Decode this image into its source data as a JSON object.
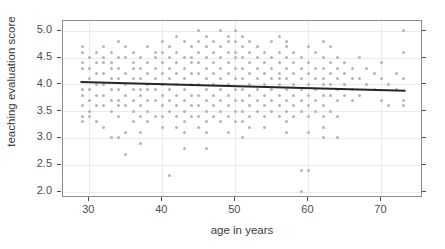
{
  "chart_data": {
    "type": "scatter",
    "title": "",
    "subtitle": "",
    "xlabel": "age in years",
    "ylabel": "teaching evaluation score",
    "xlim": [
      26.4,
      75.7
    ],
    "ylim": [
      1.88,
      5.18
    ],
    "xticks": [
      30,
      40,
      50,
      60,
      70
    ],
    "xtick_labels": [
      "30",
      "40",
      "50",
      "60",
      "70"
    ],
    "yticks": [
      2.0,
      2.5,
      3.0,
      3.5,
      4.0,
      4.5,
      5.0
    ],
    "ytick_labels": [
      "2.0",
      "2.5",
      "3.0",
      "3.5",
      "4.0",
      "4.5",
      "5.0"
    ],
    "grid": true,
    "legend": "none",
    "point_color": "#b4b4b4",
    "line_color": "#262626",
    "panel_border_color": "#8c8c8c",
    "grid_color": "#ebebeb",
    "series": [
      {
        "name": "teaching ratings",
        "marker": "circle",
        "points": [
          [
            29,
            4.3
          ],
          [
            29,
            4.4
          ],
          [
            29,
            4.6
          ],
          [
            29,
            4.7
          ],
          [
            29,
            3.9
          ],
          [
            29,
            3.8
          ],
          [
            29,
            3.6
          ],
          [
            29,
            3.4
          ],
          [
            29,
            3.3
          ],
          [
            30,
            4.3
          ],
          [
            30,
            4.5
          ],
          [
            30,
            4.1
          ],
          [
            30,
            3.9
          ],
          [
            30,
            3.7
          ],
          [
            30,
            3.5
          ],
          [
            30,
            3.4
          ],
          [
            31,
            4.6
          ],
          [
            31,
            4.4
          ],
          [
            31,
            4.2
          ],
          [
            31,
            4.0
          ],
          [
            31,
            3.8
          ],
          [
            31,
            3.6
          ],
          [
            31,
            3.3
          ],
          [
            32,
            4.7
          ],
          [
            32,
            4.5
          ],
          [
            32,
            4.4
          ],
          [
            32,
            4.2
          ],
          [
            32,
            4.0
          ],
          [
            32,
            3.8
          ],
          [
            32,
            3.6
          ],
          [
            32,
            3.2
          ],
          [
            33,
            4.6
          ],
          [
            33,
            4.4
          ],
          [
            33,
            4.3
          ],
          [
            33,
            4.1
          ],
          [
            33,
            3.9
          ],
          [
            33,
            3.7
          ],
          [
            33,
            3.5
          ],
          [
            33,
            3.0
          ],
          [
            34,
            4.8
          ],
          [
            34,
            4.5
          ],
          [
            34,
            4.3
          ],
          [
            34,
            4.1
          ],
          [
            34,
            3.9
          ],
          [
            34,
            3.7
          ],
          [
            34,
            3.6
          ],
          [
            34,
            3.4
          ],
          [
            34,
            3.0
          ],
          [
            35,
            4.7
          ],
          [
            35,
            4.5
          ],
          [
            35,
            4.2
          ],
          [
            35,
            4.0
          ],
          [
            35,
            3.8
          ],
          [
            35,
            3.6
          ],
          [
            35,
            3.1
          ],
          [
            35,
            2.7
          ],
          [
            36,
            4.6
          ],
          [
            36,
            4.4
          ],
          [
            36,
            4.3
          ],
          [
            36,
            4.1
          ],
          [
            36,
            3.9
          ],
          [
            36,
            3.7
          ],
          [
            36,
            3.5
          ],
          [
            36,
            3.3
          ],
          [
            37,
            4.5
          ],
          [
            37,
            4.3
          ],
          [
            37,
            4.1
          ],
          [
            37,
            3.9
          ],
          [
            37,
            3.8
          ],
          [
            37,
            3.6
          ],
          [
            37,
            3.4
          ],
          [
            37,
            3.1
          ],
          [
            37,
            2.9
          ],
          [
            38,
            4.7
          ],
          [
            38,
            4.4
          ],
          [
            38,
            4.2
          ],
          [
            38,
            4.0
          ],
          [
            38,
            3.9
          ],
          [
            38,
            3.7
          ],
          [
            38,
            3.5
          ],
          [
            38,
            3.3
          ],
          [
            39,
            4.6
          ],
          [
            39,
            4.5
          ],
          [
            39,
            4.3
          ],
          [
            39,
            4.1
          ],
          [
            39,
            3.9
          ],
          [
            39,
            3.7
          ],
          [
            39,
            3.4
          ],
          [
            40,
            4.8
          ],
          [
            40,
            4.6
          ],
          [
            40,
            4.4
          ],
          [
            40,
            4.2
          ],
          [
            40,
            4.0
          ],
          [
            40,
            3.8
          ],
          [
            40,
            3.6
          ],
          [
            40,
            3.4
          ],
          [
            40,
            3.2
          ],
          [
            41,
            4.7
          ],
          [
            41,
            4.5
          ],
          [
            41,
            4.3
          ],
          [
            41,
            4.1
          ],
          [
            41,
            3.9
          ],
          [
            41,
            3.7
          ],
          [
            41,
            3.5
          ],
          [
            41,
            2.3
          ],
          [
            42,
            4.9
          ],
          [
            42,
            4.6
          ],
          [
            42,
            4.4
          ],
          [
            42,
            4.2
          ],
          [
            42,
            4.0
          ],
          [
            42,
            3.8
          ],
          [
            42,
            3.6
          ],
          [
            42,
            3.4
          ],
          [
            42,
            3.2
          ],
          [
            43,
            4.8
          ],
          [
            43,
            4.5
          ],
          [
            43,
            4.3
          ],
          [
            43,
            4.1
          ],
          [
            43,
            3.9
          ],
          [
            43,
            3.7
          ],
          [
            43,
            3.5
          ],
          [
            43,
            3.3
          ],
          [
            43,
            3.1
          ],
          [
            43,
            2.8
          ],
          [
            44,
            4.7
          ],
          [
            44,
            4.5
          ],
          [
            44,
            4.4
          ],
          [
            44,
            4.2
          ],
          [
            44,
            4.0
          ],
          [
            44,
            3.8
          ],
          [
            44,
            3.6
          ],
          [
            44,
            3.4
          ],
          [
            45,
            5.0
          ],
          [
            45,
            4.8
          ],
          [
            45,
            4.6
          ],
          [
            45,
            4.4
          ],
          [
            45,
            4.2
          ],
          [
            45,
            4.0
          ],
          [
            45,
            3.8
          ],
          [
            45,
            3.6
          ],
          [
            45,
            3.4
          ],
          [
            45,
            3.2
          ],
          [
            46,
            4.9
          ],
          [
            46,
            4.7
          ],
          [
            46,
            4.5
          ],
          [
            46,
            4.3
          ],
          [
            46,
            4.1
          ],
          [
            46,
            3.9
          ],
          [
            46,
            3.7
          ],
          [
            46,
            3.5
          ],
          [
            46,
            3.3
          ],
          [
            46,
            3.1
          ],
          [
            46,
            2.8
          ],
          [
            47,
            4.8
          ],
          [
            47,
            4.6
          ],
          [
            47,
            4.4
          ],
          [
            47,
            4.2
          ],
          [
            47,
            4.0
          ],
          [
            47,
            3.8
          ],
          [
            47,
            3.6
          ],
          [
            47,
            3.4
          ],
          [
            48,
            5.0
          ],
          [
            48,
            4.7
          ],
          [
            48,
            4.5
          ],
          [
            48,
            4.3
          ],
          [
            48,
            4.1
          ],
          [
            48,
            3.9
          ],
          [
            48,
            3.7
          ],
          [
            48,
            3.5
          ],
          [
            48,
            3.3
          ],
          [
            49,
            4.9
          ],
          [
            49,
            4.8
          ],
          [
            49,
            4.6
          ],
          [
            49,
            4.4
          ],
          [
            49,
            4.2
          ],
          [
            49,
            4.0
          ],
          [
            49,
            3.8
          ],
          [
            49,
            3.6
          ],
          [
            49,
            3.4
          ],
          [
            49,
            3.1
          ],
          [
            50,
            5.0
          ],
          [
            50,
            4.8
          ],
          [
            50,
            4.6
          ],
          [
            50,
            4.5
          ],
          [
            50,
            4.3
          ],
          [
            50,
            4.1
          ],
          [
            50,
            3.9
          ],
          [
            50,
            3.7
          ],
          [
            50,
            3.5
          ],
          [
            50,
            3.3
          ],
          [
            51,
            4.9
          ],
          [
            51,
            4.7
          ],
          [
            51,
            4.5
          ],
          [
            51,
            4.3
          ],
          [
            51,
            4.1
          ],
          [
            51,
            3.9
          ],
          [
            51,
            3.7
          ],
          [
            51,
            3.5
          ],
          [
            51,
            3.3
          ],
          [
            51,
            3.0
          ],
          [
            52,
            4.8
          ],
          [
            52,
            4.6
          ],
          [
            52,
            4.4
          ],
          [
            52,
            4.2
          ],
          [
            52,
            4.0
          ],
          [
            52,
            3.8
          ],
          [
            52,
            3.6
          ],
          [
            52,
            3.4
          ],
          [
            52,
            3.2
          ],
          [
            53,
            4.7
          ],
          [
            53,
            4.5
          ],
          [
            53,
            4.3
          ],
          [
            53,
            4.1
          ],
          [
            53,
            3.9
          ],
          [
            53,
            3.7
          ],
          [
            53,
            3.5
          ],
          [
            54,
            4.6
          ],
          [
            54,
            4.4
          ],
          [
            54,
            4.2
          ],
          [
            54,
            4.0
          ],
          [
            54,
            3.8
          ],
          [
            54,
            3.6
          ],
          [
            54,
            3.4
          ],
          [
            54,
            3.2
          ],
          [
            55,
            4.8
          ],
          [
            55,
            4.5
          ],
          [
            55,
            4.3
          ],
          [
            55,
            4.1
          ],
          [
            55,
            3.9
          ],
          [
            55,
            3.7
          ],
          [
            55,
            3.5
          ],
          [
            56,
            4.9
          ],
          [
            56,
            4.6
          ],
          [
            56,
            4.4
          ],
          [
            56,
            4.2
          ],
          [
            56,
            4.0
          ],
          [
            56,
            3.8
          ],
          [
            56,
            3.6
          ],
          [
            56,
            3.4
          ],
          [
            56,
            4.1
          ],
          [
            57,
            4.8
          ],
          [
            57,
            4.7
          ],
          [
            57,
            4.5
          ],
          [
            57,
            4.3
          ],
          [
            57,
            4.1
          ],
          [
            57,
            3.9
          ],
          [
            57,
            3.7
          ],
          [
            57,
            3.5
          ],
          [
            57,
            3.3
          ],
          [
            57,
            3.1
          ],
          [
            58,
            4.6
          ],
          [
            58,
            4.4
          ],
          [
            58,
            4.2
          ],
          [
            58,
            4.0
          ],
          [
            58,
            3.8
          ],
          [
            58,
            3.6
          ],
          [
            58,
            3.4
          ],
          [
            59,
            4.5
          ],
          [
            59,
            4.3
          ],
          [
            59,
            4.1
          ],
          [
            59,
            3.9
          ],
          [
            59,
            3.7
          ],
          [
            59,
            3.5
          ],
          [
            59,
            2.4
          ],
          [
            59,
            2.0
          ],
          [
            60,
            4.7
          ],
          [
            60,
            4.4
          ],
          [
            60,
            4.2
          ],
          [
            60,
            4.0
          ],
          [
            60,
            3.8
          ],
          [
            60,
            3.6
          ],
          [
            60,
            3.4
          ],
          [
            60,
            3.1
          ],
          [
            60,
            2.4
          ],
          [
            61,
            4.6
          ],
          [
            61,
            4.3
          ],
          [
            61,
            4.1
          ],
          [
            61,
            3.9
          ],
          [
            61,
            3.7
          ],
          [
            61,
            3.5
          ],
          [
            62,
            4.8
          ],
          [
            62,
            4.5
          ],
          [
            62,
            4.3
          ],
          [
            62,
            4.1
          ],
          [
            62,
            4.0
          ],
          [
            62,
            3.8
          ],
          [
            62,
            3.6
          ],
          [
            62,
            3.4
          ],
          [
            62,
            3.2
          ],
          [
            62,
            3.0
          ],
          [
            63,
            4.7
          ],
          [
            63,
            4.4
          ],
          [
            63,
            4.2
          ],
          [
            63,
            4.0
          ],
          [
            63,
            3.8
          ],
          [
            63,
            3.5
          ],
          [
            64,
            4.5
          ],
          [
            64,
            4.3
          ],
          [
            64,
            4.1
          ],
          [
            64,
            3.9
          ],
          [
            64,
            3.7
          ],
          [
            64,
            3.4
          ],
          [
            64,
            3.0
          ],
          [
            65,
            4.4
          ],
          [
            65,
            4.2
          ],
          [
            65,
            4.0
          ],
          [
            65,
            3.8
          ],
          [
            66,
            4.3
          ],
          [
            66,
            4.1
          ],
          [
            66,
            3.9
          ],
          [
            66,
            3.7
          ],
          [
            67,
            4.5
          ],
          [
            67,
            4.1
          ],
          [
            67,
            3.8
          ],
          [
            68,
            4.3
          ],
          [
            68,
            4.0
          ],
          [
            69,
            4.2
          ],
          [
            69,
            3.9
          ],
          [
            70,
            4.4
          ],
          [
            70,
            4.1
          ],
          [
            70,
            3.7
          ],
          [
            71,
            4.0
          ],
          [
            71,
            3.6
          ],
          [
            72,
            4.2
          ],
          [
            72,
            3.9
          ],
          [
            73,
            5.0
          ],
          [
            73,
            4.6
          ],
          [
            73,
            4.1
          ],
          [
            73,
            3.7
          ],
          [
            73,
            3.6
          ]
        ]
      }
    ],
    "fit_line": {
      "name": "linear fit",
      "x_start": 28.8,
      "y_start": 4.04,
      "x_end": 73.3,
      "y_end": 3.88,
      "color": "#262626",
      "width": 2
    }
  }
}
